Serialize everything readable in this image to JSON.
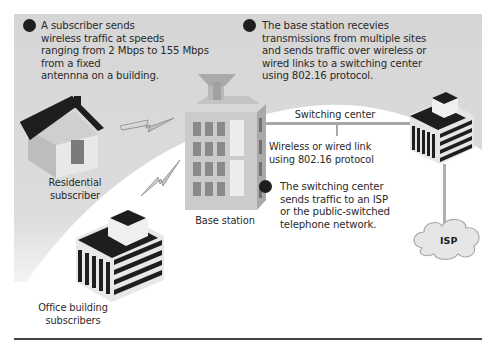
{
  "diagram": {
    "type": "wireless-network-illustration",
    "callouts": [
      {
        "id": 1,
        "lines": [
          "A subscriber sends",
          "wireless traffic at speeds",
          "ranging from 2 Mbps to 155 Mbps",
          "from a fixed",
          "antennna on a building."
        ]
      },
      {
        "id": 2,
        "lines": [
          "The base station recevies",
          "transmissions from multiple sites",
          "and sends traffic over wireless or",
          "wired links to a switching center",
          "using 802.16 protocol."
        ]
      },
      {
        "id": 3,
        "lines": [
          "The switching center",
          "sends traffic to an ISP",
          "or the public-switched",
          "telephone network."
        ]
      }
    ],
    "labels": {
      "residential": [
        "Residential",
        "subscriber"
      ],
      "office": [
        "Office building",
        "subscribers"
      ],
      "base_station": "Base station",
      "switching_center": "Switching center",
      "link": [
        "Wireless or wired link",
        "using 802.16 protocol"
      ],
      "isp": "ISP"
    },
    "nodes": [
      {
        "name": "Residential subscriber",
        "icon": "house-icon"
      },
      {
        "name": "Office building subscribers",
        "icon": "office-building-icon"
      },
      {
        "name": "Base station",
        "icon": "tower-building-icon"
      },
      {
        "name": "Switching center",
        "icon": "office-building-icon"
      },
      {
        "name": "ISP",
        "icon": "cloud-icon"
      }
    ],
    "edges": [
      {
        "from": "Residential subscriber",
        "to": "Base station",
        "style": "lightning-wireless"
      },
      {
        "from": "Office building subscribers",
        "to": "Base station",
        "style": "lightning-wireless"
      },
      {
        "from": "Base station",
        "to": "Switching center",
        "style": "line",
        "label": "Wireless or wired link using 802.16 protocol"
      },
      {
        "from": "Switching center",
        "to": "ISP",
        "style": "line"
      }
    ],
    "colors": {
      "panel": "#d9d9d9",
      "dark": "#1e1e1e",
      "mid": "#9a9a9a",
      "white": "#ffffff"
    }
  }
}
